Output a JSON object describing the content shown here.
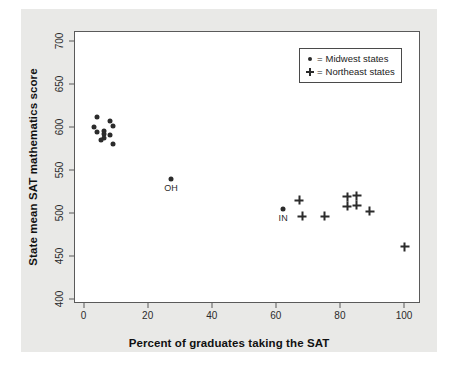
{
  "chart_data": {
    "type": "scatter",
    "title": "",
    "xlabel": "Percent of graduates taking the SAT",
    "ylabel": "State mean SAT mathematics score",
    "xlim": [
      -3,
      105
    ],
    "ylim": [
      395,
      712
    ],
    "xticks": [
      0,
      20,
      40,
      60,
      80,
      100
    ],
    "yticks": [
      400,
      450,
      500,
      550,
      600,
      650,
      700
    ],
    "grid": false,
    "legend_position": "top-right",
    "legend": [
      {
        "symbol": "dot",
        "equals": "=",
        "label": "Midwest states"
      },
      {
        "symbol": "plus",
        "equals": "=",
        "label": "Northeast states"
      }
    ],
    "series": [
      {
        "name": "Midwest states",
        "marker": "dot",
        "points": [
          {
            "x": 4,
            "y": 613
          },
          {
            "x": 8,
            "y": 608
          },
          {
            "x": 3,
            "y": 601
          },
          {
            "x": 9,
            "y": 603
          },
          {
            "x": 4,
            "y": 596
          },
          {
            "x": 6,
            "y": 597
          },
          {
            "x": 6,
            "y": 593
          },
          {
            "x": 8,
            "y": 592
          },
          {
            "x": 6,
            "y": 589
          },
          {
            "x": 5,
            "y": 586
          },
          {
            "x": 9,
            "y": 581
          },
          {
            "x": 27,
            "y": 541,
            "label": "OH"
          },
          {
            "x": 62,
            "y": 506,
            "label": "IN"
          }
        ]
      },
      {
        "name": "Northeast states",
        "marker": "plus",
        "points": [
          {
            "x": 67,
            "y": 516
          },
          {
            "x": 68,
            "y": 497
          },
          {
            "x": 75,
            "y": 497
          },
          {
            "x": 82,
            "y": 520
          },
          {
            "x": 85,
            "y": 521
          },
          {
            "x": 82,
            "y": 509
          },
          {
            "x": 85,
            "y": 510
          },
          {
            "x": 89,
            "y": 503
          },
          {
            "x": 100,
            "y": 462
          }
        ]
      }
    ],
    "annotations": [
      {
        "text": "OH",
        "x": 27,
        "y": 541
      },
      {
        "text": "IN",
        "x": 62,
        "y": 506
      }
    ],
    "colors": {
      "marker": "#2b2b2b",
      "frame": "#5a5a5a",
      "plot_background": "#ffffff",
      "page_background": "#e9e9e7"
    }
  }
}
